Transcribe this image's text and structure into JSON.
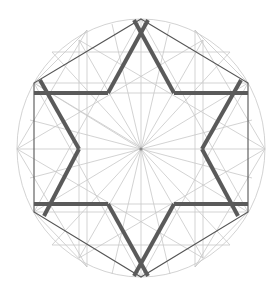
{
  "diagram": {
    "title": "",
    "colors": {
      "background": "#ffffff",
      "guide_lines": "#c8c8c8",
      "hexagon_outline": "#555555",
      "star_stroke": "#5a5a5a"
    },
    "center": [
      141,
      149
    ],
    "circle": {
      "cx": 141,
      "cy": 148,
      "rx": 124,
      "ry": 129
    },
    "hexagon_vertices": [
      [
        141,
        19
      ],
      [
        248,
        83
      ],
      [
        248,
        212
      ],
      [
        141,
        277
      ],
      [
        34,
        212
      ],
      [
        34,
        83
      ]
    ],
    "star_horizontal_bars": [
      {
        "y": 93,
        "x1": 34,
        "x2": 248
      },
      {
        "y": 204,
        "x1": 34,
        "x2": 248
      }
    ],
    "star_inner_vertices": [
      [
        108,
        93
      ],
      [
        174,
        93
      ],
      [
        202,
        149
      ],
      [
        174,
        204
      ],
      [
        108,
        204
      ],
      [
        79,
        149
      ]
    ]
  }
}
